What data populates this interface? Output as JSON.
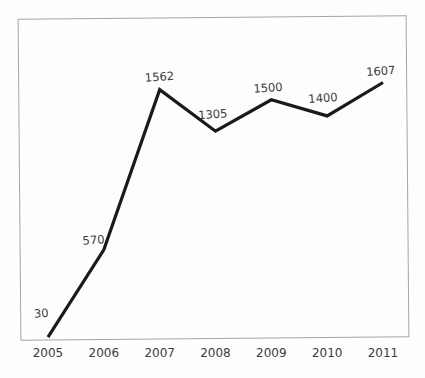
{
  "chart_data": {
    "type": "line",
    "title": "",
    "xlabel": "",
    "ylabel": "",
    "categories": [
      "2005",
      "2006",
      "2007",
      "2008",
      "2009",
      "2010",
      "2011"
    ],
    "values": [
      30,
      570,
      1562,
      1305,
      1500,
      1400,
      1607
    ],
    "point_labels": [
      "30",
      "570",
      "1562",
      "1305",
      "1500",
      "1400",
      "1607"
    ],
    "ylim": [
      0,
      2000
    ],
    "grid": false,
    "legend": false,
    "y_axis_ticks_visible": false,
    "frame": true,
    "colors": {
      "line": "#1a1a1a",
      "frame": "#a5a5a5",
      "text": "#3c3c3c"
    }
  }
}
